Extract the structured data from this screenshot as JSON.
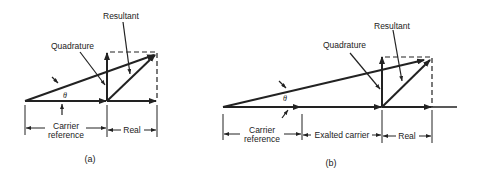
{
  "diagram_a": {
    "caption": "(a)",
    "labels": {
      "resultant": "Resultant",
      "quadrature": "Quadrature",
      "theta": "θ",
      "carrier_reference_line1": "Carrier",
      "carrier_reference_line2": "reference",
      "real": "Real"
    }
  },
  "diagram_b": {
    "caption": "(b)",
    "labels": {
      "resultant": "Resultant",
      "quadrature": "Quadrature",
      "theta": "θ",
      "carrier_reference_line1": "Carrier",
      "carrier_reference_line2": "reference",
      "exalted_carrier": "Exalted carrier",
      "real": "Real"
    }
  },
  "colors": {
    "ink": "#222222",
    "background": "#ffffff"
  }
}
